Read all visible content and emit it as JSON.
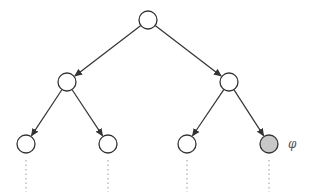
{
  "diagram": {
    "type": "binary-tree",
    "width": 316,
    "height": 196,
    "colors": {
      "stroke": "#333333",
      "node_fill": "#ffffff",
      "highlight_fill": "#c8c8c8",
      "dotted": "#999999",
      "label": "#555555"
    },
    "node_radius": 9,
    "nodes": [
      {
        "id": "root",
        "x": 148,
        "y": 20,
        "highlighted": false
      },
      {
        "id": "left",
        "x": 67,
        "y": 82,
        "highlighted": false
      },
      {
        "id": "right",
        "x": 229,
        "y": 82,
        "highlighted": false
      },
      {
        "id": "left-left",
        "x": 26,
        "y": 144,
        "highlighted": false
      },
      {
        "id": "left-right",
        "x": 108,
        "y": 144,
        "highlighted": false
      },
      {
        "id": "right-left",
        "x": 187,
        "y": 144,
        "highlighted": false
      },
      {
        "id": "right-right",
        "x": 269,
        "y": 144,
        "highlighted": true
      }
    ],
    "edges": [
      {
        "from": "root",
        "to": "left"
      },
      {
        "from": "root",
        "to": "right"
      },
      {
        "from": "left",
        "to": "left-left"
      },
      {
        "from": "left",
        "to": "left-right"
      },
      {
        "from": "right",
        "to": "right-left"
      },
      {
        "from": "right",
        "to": "right-right"
      }
    ],
    "continuations": [
      {
        "node": "left-left",
        "y_end": 192
      },
      {
        "node": "left-right",
        "y_end": 192
      },
      {
        "node": "right-left",
        "y_end": 192
      },
      {
        "node": "right-right",
        "y_end": 192
      }
    ],
    "label": {
      "text": "φ",
      "attached_to": "right-right",
      "x": 288,
      "y": 138
    }
  }
}
